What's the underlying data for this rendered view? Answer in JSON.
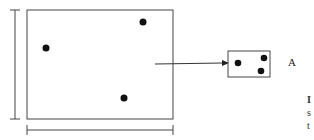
{
  "diagram": {
    "main_region": {
      "x": 27,
      "y": 10,
      "width": 146,
      "height": 109
    },
    "main_points": [
      {
        "cx": 46,
        "cy": 48
      },
      {
        "cx": 143,
        "cy": 22
      },
      {
        "cx": 124,
        "cy": 98
      }
    ],
    "inset_box": {
      "x": 228,
      "y": 51,
      "width": 42,
      "height": 26
    },
    "inset_points": [
      {
        "cx": 238,
        "cy": 63
      },
      {
        "cx": 264,
        "cy": 58
      },
      {
        "cx": 261,
        "cy": 71
      }
    ],
    "arrow": {
      "x1": 155,
      "y1": 64,
      "x2": 228,
      "y2": 63
    },
    "inset_label": "A",
    "edge_text_fragments": [
      "I",
      "s",
      "t"
    ],
    "colors": {
      "stroke": "#333333",
      "dot": "#111111"
    }
  }
}
